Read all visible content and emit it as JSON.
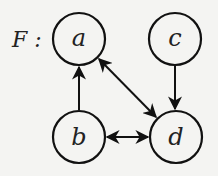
{
  "graph": {
    "label": "F :",
    "nodes": [
      {
        "id": "a",
        "label": "a",
        "cx": 79,
        "cy": 39
      },
      {
        "id": "c",
        "label": "c",
        "cx": 175,
        "cy": 39
      },
      {
        "id": "b",
        "label": "b",
        "cx": 79,
        "cy": 137
      },
      {
        "id": "d",
        "label": "d",
        "cx": 176,
        "cy": 137
      }
    ],
    "edges": [
      {
        "from": "b",
        "to": "a",
        "type": "directed"
      },
      {
        "from": "c",
        "to": "d",
        "type": "directed"
      },
      {
        "from": "a",
        "to": "d",
        "type": "bidirectional"
      },
      {
        "from": "b",
        "to": "d",
        "type": "bidirectional"
      }
    ]
  }
}
